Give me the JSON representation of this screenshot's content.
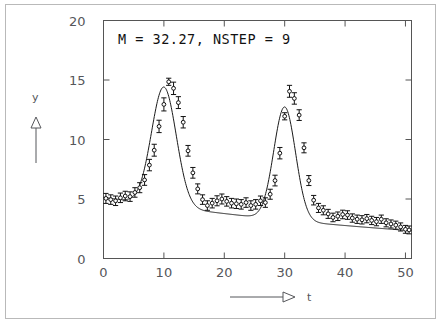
{
  "figure": {
    "annotation": "M  =   32.27, NSTEP  =     9",
    "annotation_parts": {
      "m_label": "M",
      "m_equals": "=",
      "m_value": "32.27,",
      "nstep_label": "NSTEP",
      "nstep_equals": "=",
      "nstep_value": "9"
    },
    "frame_color": "#555555",
    "curve_color": "#1a1a1a",
    "marker_color": "#111111",
    "border_color": "#b9b9b9"
  },
  "chart_data": {
    "type": "scatter",
    "title": "M  =   32.27, NSTEP  =     9",
    "xlabel": "t",
    "ylabel": "y",
    "xlim": [
      0,
      51
    ],
    "ylim": [
      0,
      20
    ],
    "xticks": [
      0,
      10,
      20,
      30,
      40,
      50
    ],
    "yticks": [
      0,
      5,
      10,
      15,
      20
    ],
    "grid": false,
    "legend": "none",
    "tick_direction": "in",
    "axis_arrows": {
      "x": "right-arrow-open-triangle",
      "y": "up-arrow-open-triangle"
    },
    "model_curve": {
      "form": "background + gaussian1 + gaussian2",
      "background": {
        "a": 5.15,
        "decay_rate": 0.0155
      },
      "gaussian1": {
        "amplitude": 10.0,
        "center": 10.0,
        "sigma": 2.05
      },
      "gaussian2": {
        "amplitude": 9.5,
        "center": 30.0,
        "sigma": 1.8
      }
    },
    "series": [
      {
        "name": "data",
        "marker": "open-circle",
        "errorbars": true,
        "x": [
          0.4,
          1.2,
          2.0,
          2.8,
          3.6,
          4.4,
          5.2,
          6.0,
          6.8,
          7.6,
          8.4,
          9.2,
          10.0,
          10.8,
          11.6,
          12.4,
          13.2,
          14.0,
          14.8,
          15.6,
          16.4,
          17.2,
          18.0,
          18.8,
          19.6,
          20.4,
          21.2,
          22.0,
          22.8,
          23.6,
          24.4,
          25.2,
          26.0,
          26.8,
          27.6,
          28.4,
          29.2,
          30.0,
          30.8,
          31.6,
          32.4,
          33.2,
          34.0,
          34.8,
          35.6,
          36.4,
          37.2,
          38.0,
          38.8,
          39.6,
          40.4,
          41.2,
          42.0,
          42.8,
          43.6,
          44.4,
          45.2,
          46.0,
          46.8,
          47.6,
          48.4,
          49.2,
          50.0,
          50.6
        ],
        "y": [
          5.05,
          4.95,
          4.85,
          5.1,
          5.25,
          5.2,
          5.55,
          5.95,
          6.6,
          7.85,
          9.1,
          11.1,
          12.95,
          14.85,
          14.3,
          13.1,
          11.45,
          9.05,
          7.2,
          5.85,
          4.95,
          4.45,
          4.65,
          4.85,
          5.0,
          4.8,
          4.65,
          4.6,
          4.55,
          4.7,
          4.45,
          4.55,
          4.85,
          4.7,
          5.4,
          6.55,
          8.85,
          11.95,
          14.05,
          13.45,
          12.05,
          9.3,
          6.55,
          4.9,
          4.25,
          4.05,
          3.75,
          3.45,
          3.55,
          3.7,
          3.65,
          3.4,
          3.3,
          3.25,
          3.35,
          3.2,
          3.1,
          3.3,
          3.0,
          2.9,
          2.8,
          2.65,
          2.45,
          2.4
        ],
        "yerr": [
          0.42,
          0.4,
          0.4,
          0.4,
          0.4,
          0.4,
          0.4,
          0.42,
          0.45,
          0.48,
          0.5,
          0.52,
          0.55,
          0.3,
          0.52,
          0.5,
          0.48,
          0.45,
          0.45,
          0.42,
          0.4,
          0.4,
          0.4,
          0.42,
          0.42,
          0.4,
          0.4,
          0.4,
          0.4,
          0.4,
          0.4,
          0.4,
          0.4,
          0.4,
          0.42,
          0.45,
          0.48,
          0.3,
          0.5,
          0.48,
          0.45,
          0.42,
          0.42,
          0.4,
          0.38,
          0.38,
          0.38,
          0.36,
          0.36,
          0.36,
          0.36,
          0.35,
          0.35,
          0.35,
          0.35,
          0.35,
          0.35,
          0.35,
          0.34,
          0.34,
          0.34,
          0.34,
          0.33,
          0.33
        ]
      }
    ]
  },
  "axes": {
    "x_tick_labels": [
      "0",
      "10",
      "20",
      "30",
      "40",
      "50"
    ],
    "y_tick_labels": [
      "0",
      "5",
      "10",
      "15",
      "20"
    ],
    "x_axis_label": "t",
    "y_axis_label": "y"
  }
}
